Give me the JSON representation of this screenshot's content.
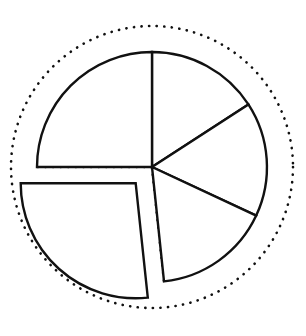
{
  "chart_data": {
    "type": "pie",
    "title": "",
    "subtitle": "",
    "xlabel": "",
    "ylabel": "",
    "grid": false,
    "legend": false,
    "legend_position": "none",
    "style": {
      "fill_color": "#ffffff",
      "stroke_color": "#111111",
      "guide_color": "#111111",
      "background_color": "#ffffff",
      "line_width_px": 2.4,
      "guide_line_style": "dotted"
    },
    "geometry": {
      "center_x": 152,
      "center_y": 167,
      "pie_radius": 115,
      "guide_circle_radius": 141,
      "start_angle_deg": 90,
      "direction": "clockwise",
      "explode_offset_px": 23,
      "explode_direction_deg": 225
    },
    "categories": [
      "Slice 1",
      "Slice 2",
      "Slice 3",
      "Slice 4",
      "Slice 5"
    ],
    "values": [
      25,
      16,
      18,
      16,
      25
    ],
    "labels": [
      "",
      "",
      "",
      "",
      ""
    ],
    "slices": [
      {
        "name": "Slice 1",
        "value": 25,
        "percent": 25,
        "start_angle_deg": 90,
        "end_angle_deg": 33,
        "exploded": false
      },
      {
        "name": "Slice 2",
        "value": 16,
        "percent": 16,
        "start_angle_deg": 33,
        "end_angle_deg": -25,
        "exploded": false
      },
      {
        "name": "Slice 3",
        "value": 18,
        "percent": 18,
        "start_angle_deg": -25,
        "end_angle_deg": -84,
        "exploded": false
      },
      {
        "name": "Slice 4",
        "value": 16,
        "percent": 16,
        "start_angle_deg": -84,
        "end_angle_deg": -180,
        "exploded": true
      },
      {
        "name": "Slice 5",
        "value": 25,
        "percent": 25,
        "start_angle_deg": 180,
        "end_angle_deg": 90,
        "exploded": false
      }
    ],
    "annotations": [
      {
        "name": "guide-circle",
        "type": "dotted-circle",
        "description": "dotted reference circle surrounding the pie"
      },
      {
        "name": "guide-radius",
        "type": "dotted-line",
        "description": "dotted radius marking the original position of the exploded slice"
      }
    ]
  }
}
